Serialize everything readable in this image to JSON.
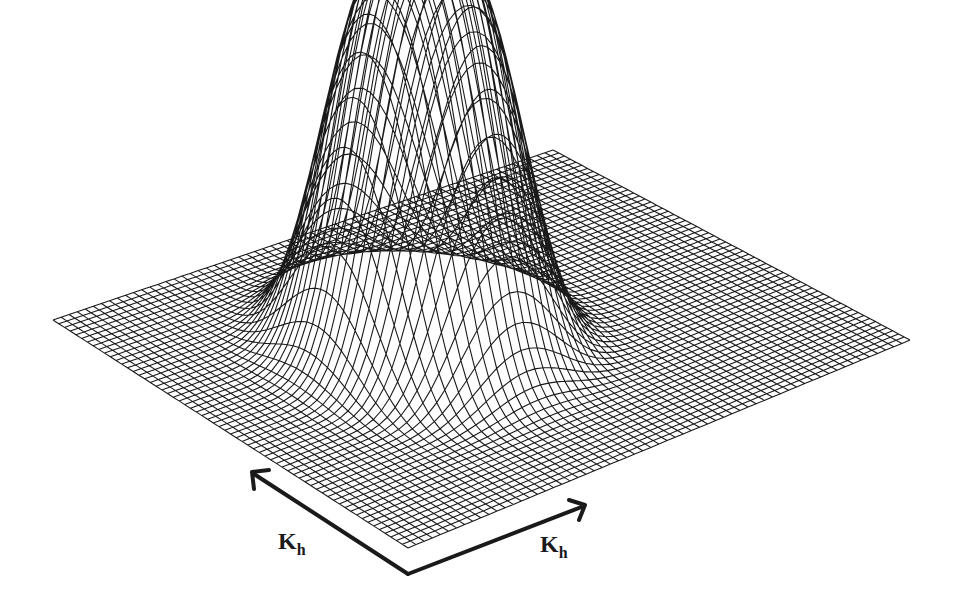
{
  "figure": {
    "line_color": "#1a1a1a",
    "background": "#ffffff",
    "grid_resolution": 62
  },
  "axes": {
    "left": {
      "label_main": "K",
      "label_sub": "h"
    },
    "right": {
      "label_main": "K",
      "label_sub": "h"
    }
  }
}
